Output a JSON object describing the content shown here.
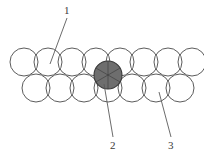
{
  "figure": {
    "type": "lattice-diagram",
    "background_color": "#ffffff",
    "outline_color": "#4a4a4a",
    "shaded_color": "#6e6e6e",
    "shaded_stroke_color": "#3a3a3a",
    "leader_color": "#5a5a5a",
    "sphere_radius": 14,
    "rows": [
      {
        "name": "top-row",
        "count": 8,
        "center_y": 62,
        "start_x": 24,
        "spacing": 24
      },
      {
        "name": "bottom-row",
        "count": 7,
        "center_y": 88,
        "start_x": 36,
        "spacing": 24
      }
    ],
    "shaded_sphere": {
      "name": "interstitial-sphere",
      "center_x": 108,
      "center_y": 75,
      "radius": 14,
      "spoke_count": 6
    }
  },
  "callouts": [
    {
      "id": "1",
      "label": "1",
      "label_x": 64,
      "label_y": 5,
      "line_x1": 67,
      "line_y1": 18,
      "line_x2": 50,
      "line_y2": 64,
      "target": "top-row-sphere"
    },
    {
      "id": "2",
      "label": "2",
      "label_x": 110,
      "label_y": 140,
      "line_x1": 113,
      "line_y1": 137,
      "line_x2": 104,
      "line_y2": 84,
      "target": "interstitial-sphere"
    },
    {
      "id": "3",
      "label": "3",
      "label_x": 168,
      "label_y": 140,
      "line_x1": 171,
      "line_y1": 137,
      "line_x2": 159,
      "line_y2": 92,
      "target": "bottom-row-sphere"
    }
  ]
}
